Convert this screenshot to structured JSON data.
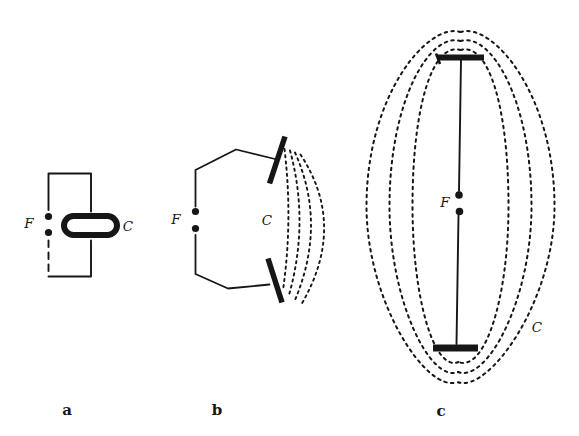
{
  "colors": {
    "paper": "#ffffff",
    "ink": "#161616"
  },
  "panels": {
    "a": {
      "caption": "a",
      "feed_point_label": "F",
      "capacitor_label": "C"
    },
    "b": {
      "caption": "b",
      "feed_point_label": "F",
      "capacitor_label": "C"
    },
    "c": {
      "caption": "c",
      "feed_point_label": "F",
      "capacitor_label": "C"
    }
  }
}
